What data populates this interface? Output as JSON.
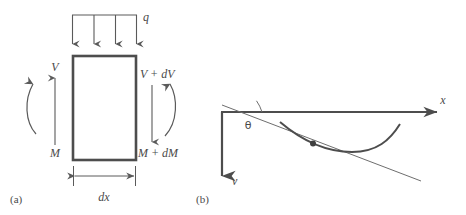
{
  "figure": {
    "panels": [
      {
        "tag": "(a)",
        "name": "free-body-diagram-of-beam-element",
        "labels": {
          "distributed_load": "q",
          "shear_left": "V",
          "moment_left": "M",
          "shear_right": "V + dV",
          "moment_right": "M + dM",
          "width_dimension": "dx"
        },
        "load_arrow_count": 4
      },
      {
        "tag": "(b)",
        "name": "deflection-curve-with-tangent",
        "labels": {
          "x_axis": "x",
          "v_axis": "v",
          "slope_angle": "θ"
        }
      }
    ],
    "colors": {
      "line": "#5a5a5a",
      "heavy_line": "#4d4d4d",
      "thin_line": "#6e6e6e",
      "text": "#4a4a4a",
      "background": "#ffffff"
    }
  }
}
